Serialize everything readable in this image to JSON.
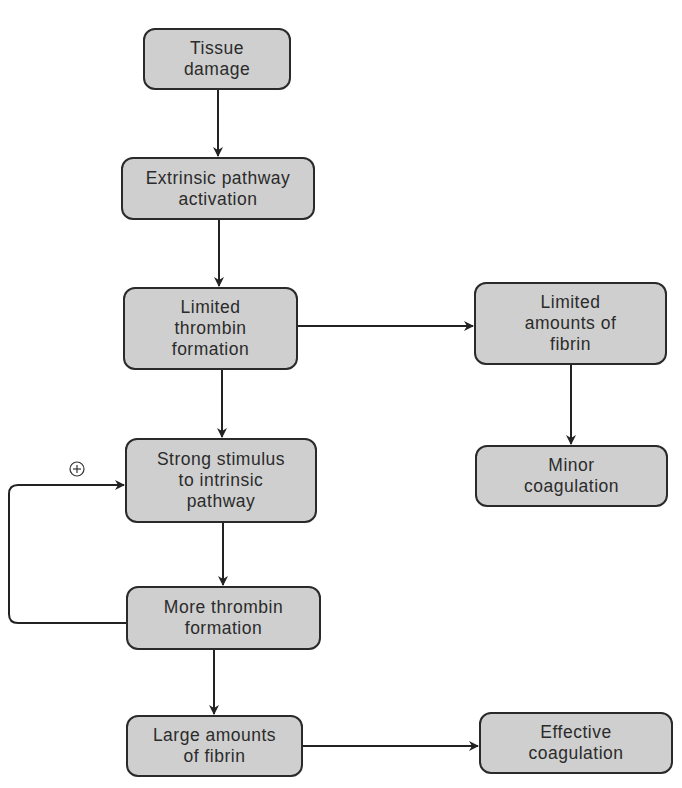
{
  "diagram": {
    "type": "flowchart",
    "colors": {
      "box_fill": "#cfcfcf",
      "box_border": "#2a2a2a",
      "line": "#222222",
      "text": "#2b2b2b"
    },
    "nodes": [
      {
        "id": "tissue_damage",
        "label": "Tissue\ndamage"
      },
      {
        "id": "extrinsic",
        "label": "Extrinsic pathway\nactivation"
      },
      {
        "id": "limited_thrombin",
        "label": "Limited\nthrombin\nformation"
      },
      {
        "id": "limited_fibrin",
        "label": "Limited\namounts of\nfibrin"
      },
      {
        "id": "minor_coag",
        "label": "Minor\ncoagulation"
      },
      {
        "id": "strong_stimulus",
        "label": "Strong stimulus\nto intrinsic\npathway"
      },
      {
        "id": "more_thrombin",
        "label": "More thrombin\nformation"
      },
      {
        "id": "large_fibrin",
        "label": "Large amounts\nof fibrin"
      },
      {
        "id": "effective_coag",
        "label": "Effective\ncoagulation"
      }
    ],
    "edges": [
      {
        "from": "tissue_damage",
        "to": "extrinsic"
      },
      {
        "from": "extrinsic",
        "to": "limited_thrombin"
      },
      {
        "from": "limited_thrombin",
        "to": "limited_fibrin"
      },
      {
        "from": "limited_fibrin",
        "to": "minor_coag"
      },
      {
        "from": "limited_thrombin",
        "to": "strong_stimulus"
      },
      {
        "from": "strong_stimulus",
        "to": "more_thrombin"
      },
      {
        "from": "more_thrombin",
        "to": "strong_stimulus",
        "label": "+",
        "kind": "positive-feedback"
      },
      {
        "from": "more_thrombin",
        "to": "large_fibrin"
      },
      {
        "from": "large_fibrin",
        "to": "effective_coag"
      }
    ],
    "feedback_symbol": "⊕"
  }
}
